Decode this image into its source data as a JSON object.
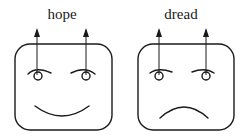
{
  "faces": [
    {
      "label": "hope",
      "expression": "smile",
      "eyebrow_style": "raised-outer"
    },
    {
      "label": "dread",
      "expression": "frown",
      "eyebrow_style": "lowered-outer"
    }
  ],
  "colors": {
    "stroke": "#1a1a1a",
    "background": "#ffffff"
  }
}
